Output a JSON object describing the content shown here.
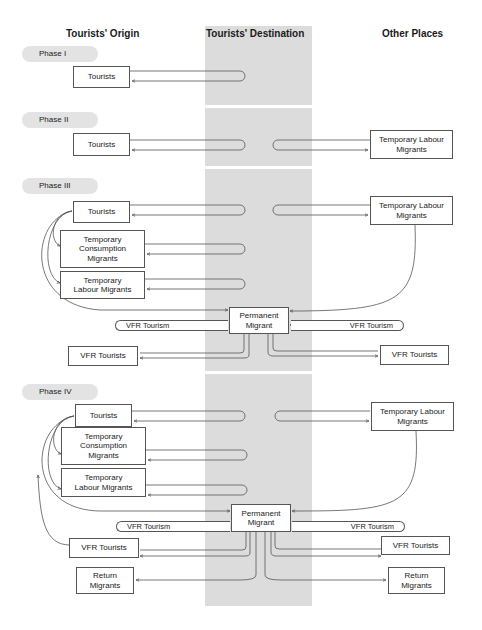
{
  "columns": {
    "origin": "Tourists' Origin",
    "destination": "Tourists' Destination",
    "other": "Other Places"
  },
  "colors": {
    "band": "#dcdcdc",
    "phase_pill": "#e3e3e3",
    "line": "#555555"
  },
  "phases": [
    {
      "label": "Phase I",
      "origin_boxes": [
        "Tourists"
      ],
      "other_boxes": []
    },
    {
      "label": "Phase II",
      "origin_boxes": [
        "Tourists"
      ],
      "other_boxes": [
        "Temporary Labour Migrants"
      ]
    },
    {
      "label": "Phase III",
      "origin_boxes": [
        "Tourists",
        "Temporary Consumption Migrants",
        "Temporary Labour Migrants",
        "VFR Tourists"
      ],
      "destination_boxes": [
        "Permanent Migrant"
      ],
      "other_boxes": [
        "Temporary Labour Migrants",
        "VFR Tourists"
      ],
      "flows": [
        "VFR Tourism",
        "VFR Tourism"
      ]
    },
    {
      "label": "Phase IV",
      "origin_boxes": [
        "Tourists",
        "Temporary Consumption Migrants",
        "Temporary Labour Migrants",
        "VFR Tourists",
        "Return Migrants"
      ],
      "destination_boxes": [
        "Permanent Migrant"
      ],
      "other_boxes": [
        "Temporary Labour Migrants",
        "VFR Tourists",
        "Return Migrants"
      ],
      "flows": [
        "VFR Tourism",
        "VFR Tourism"
      ]
    }
  ],
  "labels": {
    "tourists": "Tourists",
    "tcm_1": "Temporary",
    "tcm_2": "Consumption",
    "tcm_3": "Migrants",
    "tlm_1": "Temporary",
    "tlm_2": "Labour Migrants",
    "tlm_other_1": "Temporary Labour",
    "tlm_other_2": "Migrants",
    "pm_1": "Permanent",
    "pm_2": "Migrant",
    "vfr_tourism": "VFR Tourism",
    "vfr_tourists": "VFR Tourists",
    "rm_1": "Return",
    "rm_2": "Migrants"
  }
}
